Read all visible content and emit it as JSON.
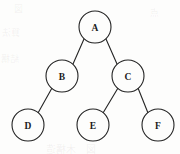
{
  "figure": {
    "kind": "binary-tree-diagram",
    "background_color": "#fdfdfc",
    "stroke_color": "#242424",
    "label_color": "#1b1b1b",
    "width": 180,
    "height": 154
  },
  "nodes": [
    {
      "id": "A",
      "label": "A",
      "cx": 95,
      "cy": 27,
      "r": 16
    },
    {
      "id": "B",
      "label": "B",
      "cx": 62,
      "cy": 76,
      "r": 16
    },
    {
      "id": "C",
      "label": "C",
      "cx": 128,
      "cy": 76,
      "r": 16
    },
    {
      "id": "D",
      "label": "D",
      "cx": 28,
      "cy": 125,
      "r": 16
    },
    {
      "id": "E",
      "label": "E",
      "cx": 93,
      "cy": 125,
      "r": 16
    },
    {
      "id": "F",
      "label": "F",
      "cx": 158,
      "cy": 125,
      "r": 16
    }
  ],
  "edges": [
    {
      "id": "A-B",
      "from": "A",
      "to": "B",
      "x1": 84,
      "y1": 39,
      "x2": 73,
      "y2": 64
    },
    {
      "id": "A-C",
      "from": "A",
      "to": "C",
      "x1": 106,
      "y1": 39,
      "x2": 117,
      "y2": 64
    },
    {
      "id": "B-D",
      "from": "B",
      "to": "D",
      "x1": 52,
      "y1": 88,
      "x2": 38,
      "y2": 113
    },
    {
      "id": "C-E",
      "from": "C",
      "to": "E",
      "x1": 118,
      "y1": 88,
      "x2": 103,
      "y2": 113
    },
    {
      "id": "C-F",
      "from": "C",
      "to": "F",
      "x1": 138,
      "y1": 88,
      "x2": 148,
      "y2": 113
    }
  ],
  "artifacts": {
    "left_bleed": "算法",
    "left_bleed_2": "結構",
    "top_bleed": "図",
    "bottom_bleed": "図　木構造",
    "right_bleed": "点"
  }
}
